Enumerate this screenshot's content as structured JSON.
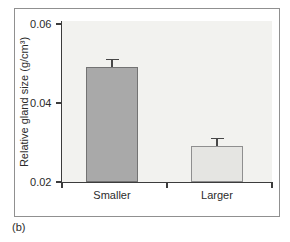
{
  "panel_label": "(b)",
  "colors": {
    "figure_border": "#909090",
    "plot_bg": "#f2f2ef",
    "axis": "#3c3c3c",
    "text": "#2b2b2b",
    "bar_fills": [
      "#a9a9a9",
      "#e5e5e2"
    ],
    "bar_borders": [
      "#737373",
      "#8f8f8f"
    ],
    "error_bar": "#474747"
  },
  "chart_data": {
    "type": "bar",
    "categories": [
      "Smaller",
      "Larger"
    ],
    "values": [
      0.049,
      0.029
    ],
    "errors_upper": [
      0.002,
      0.002
    ],
    "title": "",
    "xlabel": "",
    "ylabel": "Relative gland size (g/cm³)",
    "ylim": [
      0.02,
      0.06
    ],
    "yticks": [
      0.06,
      0.04,
      0.02
    ],
    "ytick_labels": [
      "0.06",
      "0.04",
      "0.02"
    ],
    "grid": false,
    "legend": null
  }
}
